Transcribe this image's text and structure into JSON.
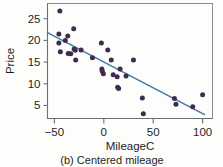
{
  "figure": {
    "caption": "(b) Centered mileage",
    "point_color": "#3f2b4e",
    "line_color": "#3f7aa8",
    "axis_color": "#6f6f6f",
    "frame_color": "#8c8c8c",
    "background": "#fdfdfc"
  },
  "chart_data": {
    "type": "scatter",
    "title": "",
    "subtitle": "",
    "xlabel": "MileageC",
    "ylabel": "Price",
    "xlim": [
      -57,
      110
    ],
    "ylim": [
      2.0,
      28.5
    ],
    "xticks": [
      -50,
      0,
      50,
      100
    ],
    "xticklabels": [
      "−50",
      "0",
      "50",
      "100"
    ],
    "yticks": [
      5,
      10,
      15,
      20,
      25
    ],
    "yticklabels": [
      "5",
      "10",
      "15",
      "20",
      "25"
    ],
    "grid": false,
    "legend": null,
    "series": [
      {
        "name": "Price vs MileageC",
        "type": "scatter",
        "marker": "circle",
        "color": "#3f2b4e",
        "points": [
          [
            -44.5,
            26.8
          ],
          [
            -45.5,
            21.5
          ],
          [
            -45.5,
            19.4
          ],
          [
            -44.0,
            17.4
          ],
          [
            -39.0,
            20.0
          ],
          [
            -36.5,
            21.0
          ],
          [
            -36.0,
            17.0
          ],
          [
            -33.5,
            16.9
          ],
          [
            -30.5,
            22.7
          ],
          [
            -30.0,
            18.0
          ],
          [
            -29.0,
            17.7
          ],
          [
            -28.5,
            15.5
          ],
          [
            -23.0,
            17.8
          ],
          [
            -11.5,
            16.0
          ],
          [
            -2.5,
            19.4
          ],
          [
            -2.0,
            13.4
          ],
          [
            -1.5,
            12.9
          ],
          [
            -0.5,
            12.3
          ],
          [
            4.0,
            17.8
          ],
          [
            7.5,
            15.5
          ],
          [
            9.5,
            12.1
          ],
          [
            13.5,
            11.6
          ],
          [
            14.0,
            9.2
          ],
          [
            15.0,
            8.9
          ],
          [
            16.5,
            13.4
          ],
          [
            22.5,
            11.8
          ],
          [
            30.0,
            15.5
          ],
          [
            39.0,
            6.7
          ],
          [
            40.0,
            3.1
          ],
          [
            71.5,
            6.6
          ],
          [
            73.0,
            5.3
          ],
          [
            90.0,
            4.7
          ],
          [
            100.0,
            7.5
          ]
        ]
      },
      {
        "name": "fitted regression line",
        "type": "line",
        "color": "#3f7aa8",
        "endpoints": [
          [
            -57.0,
            21.8
          ],
          [
            102.0,
            2.9
          ]
        ]
      }
    ]
  }
}
